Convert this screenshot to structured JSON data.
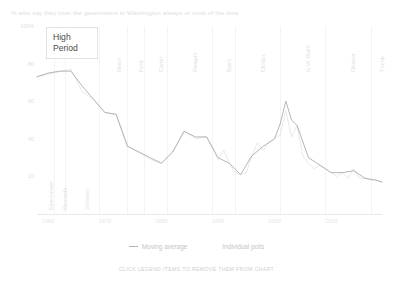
{
  "chart_data": {
    "type": "line",
    "title": "% who say they trust the government in Washington always or most of the time",
    "xlabel": "",
    "ylabel": "",
    "xlim": [
      1958,
      2019
    ],
    "ylim": [
      0,
      100
    ],
    "grid": false,
    "legend_position": "bottom",
    "yticks": [
      "100%",
      "80",
      "60",
      "40",
      "20"
    ],
    "ytick_values": [
      100,
      80,
      60,
      40,
      20
    ],
    "xticks": [
      "1960",
      "1970",
      "1980",
      "1990",
      "2000",
      "2010"
    ],
    "xtick_values": [
      1960,
      1970,
      1980,
      1990,
      2000,
      2010
    ],
    "annotations": [
      {
        "label": "High Period",
        "x": 1961,
        "y": 77
      }
    ],
    "eras": [
      {
        "label": "Eisenhower",
        "start": 1958,
        "end": 1961
      },
      {
        "label": "Kennedy",
        "start": 1961,
        "end": 1963
      },
      {
        "label": "Johnson",
        "start": 1963,
        "end": 1969
      },
      {
        "label": "Nixon",
        "start": 1969,
        "end": 1974
      },
      {
        "label": "Ford",
        "start": 1974,
        "end": 1977
      },
      {
        "label": "Carter",
        "start": 1977,
        "end": 1981
      },
      {
        "label": "Reagan",
        "start": 1981,
        "end": 1989
      },
      {
        "label": "Bush",
        "start": 1989,
        "end": 1993
      },
      {
        "label": "Clinton",
        "start": 1993,
        "end": 2001
      },
      {
        "label": "G.W. Bush",
        "start": 2001,
        "end": 2009
      },
      {
        "label": "Obama",
        "start": 2009,
        "end": 2017
      },
      {
        "label": "Trump",
        "start": 2017,
        "end": 2019
      }
    ],
    "series": [
      {
        "name": "Individual polls",
        "color": "#d2d2d2",
        "x": [
          1958,
          1964,
          1966,
          1968,
          1970,
          1972,
          1974,
          1976,
          1978,
          1980,
          1982,
          1984,
          1986,
          1988,
          1990,
          1991,
          1992,
          1993,
          1994,
          1995,
          1996,
          1997,
          1998,
          1999,
          2000,
          2001,
          2002,
          2003,
          2004,
          2005,
          2006,
          2007,
          2008,
          2009,
          2010,
          2011,
          2012,
          2013,
          2014,
          2015,
          2016,
          2017,
          2018,
          2019
        ],
        "values": [
          73,
          77,
          65,
          61,
          54,
          53,
          36,
          33,
          29,
          27,
          33,
          44,
          40,
          41,
          29,
          34,
          27,
          22,
          21,
          22,
          31,
          38,
          34,
          38,
          40,
          42,
          55,
          41,
          47,
          31,
          27,
          24,
          26,
          24,
          22,
          20,
          22,
          19,
          24,
          19,
          19,
          18,
          18,
          17
        ]
      },
      {
        "name": "Moving average",
        "color": "#9e9e9e",
        "x": [
          1958,
          1960,
          1962,
          1964,
          1966,
          1968,
          1970,
          1972,
          1974,
          1976,
          1978,
          1980,
          1982,
          1984,
          1986,
          1988,
          1990,
          1992,
          1994,
          1996,
          1998,
          2000,
          2001,
          2002,
          2003,
          2004,
          2006,
          2008,
          2010,
          2012,
          2014,
          2016,
          2018,
          2019
        ],
        "values": [
          73,
          75,
          76,
          76,
          68,
          61,
          54,
          53,
          36,
          33,
          30,
          27,
          33,
          44,
          41,
          41,
          30,
          27,
          21,
          31,
          36,
          40,
          48,
          60,
          50,
          47,
          30,
          26,
          22,
          22,
          23,
          19,
          18,
          17
        ]
      }
    ]
  },
  "legend": {
    "items": [
      {
        "label": "Moving average",
        "marker": "line"
      },
      {
        "label": "Individual polls",
        "marker": "dots"
      }
    ]
  },
  "caption": "CLICK LEGEND ITEMS TO REMOVE THEM FROM CHART"
}
